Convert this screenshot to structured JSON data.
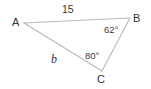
{
  "figure": {
    "type": "triangle-diagram",
    "background_color": "#ffffff",
    "line_color": "#b8b8b8",
    "text_color": "#333333",
    "vertices": [
      {
        "id": "A",
        "label": "A",
        "x": 24,
        "y": 23
      },
      {
        "id": "B",
        "label": "B",
        "x": 130,
        "y": 18
      },
      {
        "id": "C",
        "label": "C",
        "x": 102,
        "y": 71
      }
    ],
    "sides": [
      {
        "id": "AB",
        "label": "15",
        "from": "A",
        "to": "B",
        "style": "plain"
      },
      {
        "id": "BC",
        "label": "",
        "from": "B",
        "to": "C",
        "style": "plain"
      },
      {
        "id": "AC",
        "label": "b",
        "from": "A",
        "to": "C",
        "style": "italic"
      }
    ],
    "angles": [
      {
        "at": "B",
        "label": "62°",
        "value": 62
      },
      {
        "at": "C",
        "label": "80°",
        "value": 80
      }
    ]
  }
}
